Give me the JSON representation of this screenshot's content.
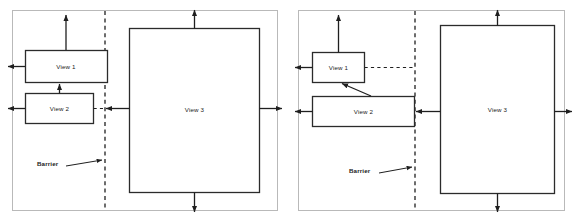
{
  "figure": {
    "type": "diagram",
    "panels": [
      {
        "id": "left-panel",
        "name": "left-variant",
        "barrier_label": "Barrier",
        "boxes": [
          {
            "id": "view1",
            "label": "View 1"
          },
          {
            "id": "view2",
            "label": "View 2"
          },
          {
            "id": "view3",
            "label": "View 3"
          }
        ]
      },
      {
        "id": "right-panel",
        "name": "right-variant",
        "barrier_label": "Barrier",
        "boxes": [
          {
            "id": "view1",
            "label": "View 1"
          },
          {
            "id": "view2",
            "label": "View 2"
          },
          {
            "id": "view3",
            "label": "View 3"
          }
        ]
      }
    ]
  },
  "colors": {
    "background": "#ffffff",
    "frame_stroke": "#b9b9b9",
    "box_stroke": "#2b2b2b",
    "line_stroke": "#1f1f1f",
    "text": "#1a1a1a"
  }
}
